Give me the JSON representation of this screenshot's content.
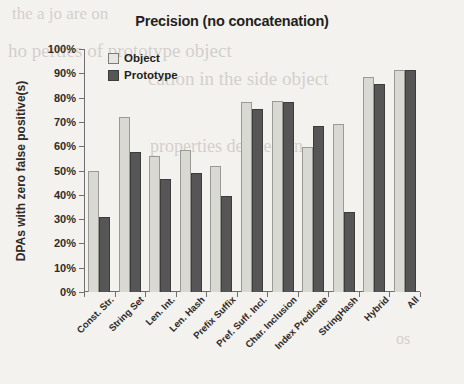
{
  "chart_data": {
    "type": "bar",
    "title": "Precision (no concatenation)",
    "xlabel": "",
    "ylabel": "DPAs  with zero false positive(s)",
    "ylim": [
      0,
      100
    ],
    "ytick_labels": [
      "0%",
      "10%",
      "20%",
      "30%",
      "40%",
      "50%",
      "60%",
      "70%",
      "80%",
      "90%",
      "100%"
    ],
    "ytick_values": [
      0,
      10,
      20,
      30,
      40,
      50,
      60,
      70,
      80,
      90,
      100
    ],
    "grid": false,
    "legend_position": "top-left",
    "categories": [
      "Const. Str.",
      "String Set",
      "Len. Int.",
      "Len. Hash",
      "Prefix Suffix",
      "Pref. Suff. Incl.",
      "Char. Inclusion",
      "Index Predicate",
      "StringHash",
      "Hybrid",
      "All"
    ],
    "series": [
      {
        "name": "Object",
        "color": "#d9d9d4",
        "values": [
          50,
          72,
          56,
          58.5,
          52,
          78,
          78.5,
          59.5,
          69,
          88.5,
          91.5
        ]
      },
      {
        "name": "Prototype",
        "color": "#565656",
        "values": [
          31,
          57.5,
          46.5,
          49,
          39.5,
          75.5,
          78,
          68.5,
          33,
          85.5,
          91.5
        ]
      }
    ]
  },
  "legend": {
    "items": [
      {
        "label": "Object",
        "swatch": "light-square-swatch"
      },
      {
        "label": "Prototype",
        "swatch": "dark-square-swatch"
      }
    ]
  },
  "background_bleed": [
    "the  a  jo  are  on",
    "ho perties  of prototype  object",
    "cation in the side object",
    "properties  defined  on",
    "os"
  ]
}
